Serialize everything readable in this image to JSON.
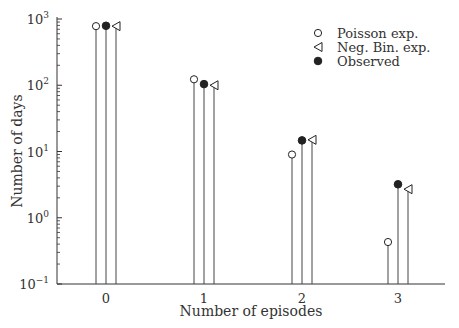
{
  "chart_data": {
    "type": "stem",
    "title": "",
    "xlabel": "Number of episodes",
    "ylabel": "Number of days",
    "yscale": "log",
    "ylim": [
      0.1,
      1000
    ],
    "y_ticks": [
      {
        "value": 0.001,
        "base": "10",
        "exp": "−1"
      },
      {
        "value": 1,
        "base": "10",
        "exp": "0"
      },
      {
        "value": 10,
        "base": "10",
        "exp": "1"
      },
      {
        "value": 100,
        "base": "10",
        "exp": "2"
      },
      {
        "value": 1000,
        "base": "10",
        "exp": "3"
      }
    ],
    "categories": [
      "0",
      "1",
      "2",
      "3"
    ],
    "series": [
      {
        "name": "Poisson exp.",
        "marker": "open-circle",
        "values": [
          780,
          123,
          9,
          0.43
        ]
      },
      {
        "name": "Observed",
        "marker": "filled-circle",
        "values": [
          790,
          104,
          14.7,
          3.2
        ]
      },
      {
        "name": "Neg. Bin. exp.",
        "marker": "open-triangle-left",
        "values": [
          780,
          100,
          15,
          2.7
        ]
      }
    ],
    "legend": {
      "position": "upper right",
      "entries": [
        {
          "label": "Poisson exp.",
          "marker": "open-circle"
        },
        {
          "label": "Neg. Bin. exp.",
          "marker": "open-triangle-left"
        },
        {
          "label": "Observed",
          "marker": "filled-circle"
        }
      ]
    },
    "grid": false
  },
  "colors": {
    "axis": "#333333",
    "stem": "#444444",
    "marker": "#222222"
  }
}
